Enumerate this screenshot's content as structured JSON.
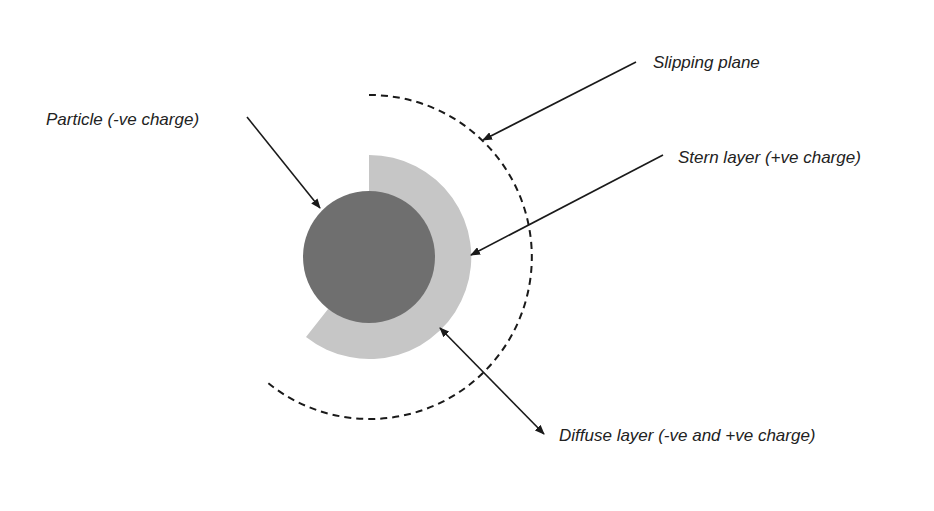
{
  "diagram": {
    "labels": {
      "particle": "Particle (-ve charge)",
      "slipping_plane": "Slipping plane",
      "stern_layer": "Stern layer (+ve charge)",
      "diffuse_layer": "Diffuse layer (-ve and +ve charge)"
    },
    "colors": {
      "particle": "#6f6f6f",
      "stern_layer": "#c6c6c6",
      "line": "#1a1a1a",
      "background": "#ffffff"
    }
  }
}
